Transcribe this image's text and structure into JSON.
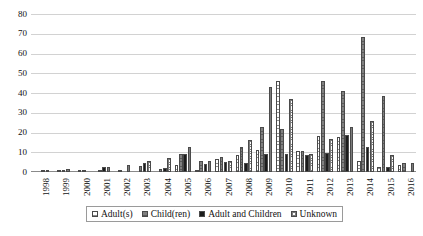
{
  "chart_data": {
    "type": "bar",
    "title": "",
    "subtitle": "",
    "xlabel": "",
    "ylabel": "",
    "ylim": [
      0,
      80
    ],
    "yticks": [
      0,
      10,
      20,
      30,
      40,
      50,
      60,
      70,
      80
    ],
    "grid": true,
    "legend_position": "bottom",
    "categories": [
      "1998",
      "1999",
      "2000",
      "2001",
      "2002",
      "2003",
      "2004",
      "2005",
      "2006",
      "2007",
      "2008",
      "2009",
      "2010",
      "2011",
      "2012",
      "2013",
      "2014",
      "2015",
      "2016"
    ],
    "series": [
      {
        "name": "Adult(s)",
        "pattern": "horizontal-lines",
        "color": "#f7f7f7",
        "values": [
          0,
          0,
          0,
          0,
          0,
          0,
          0,
          3.6,
          0.8,
          6.4,
          8.6,
          11,
          46,
          10.8,
          18,
          17.8,
          5.6,
          2.6,
          3.6
        ]
      },
      {
        "name": "Child(ren)",
        "pattern": "solid-gray",
        "color": "#6e6e6e",
        "values": [
          0,
          0.4,
          0.4,
          1,
          0.8,
          3,
          1.4,
          9,
          5.8,
          7.8,
          12.8,
          23,
          21.8,
          10.8,
          46,
          41,
          68.6,
          38.6,
          4.4
        ]
      },
      {
        "name": "Adult and Children",
        "pattern": "solid-black",
        "color": "#1c1c1c",
        "values": [
          0.8,
          1.2,
          0.6,
          2.4,
          0,
          4.6,
          2.2,
          9,
          4,
          5.2,
          4.6,
          9,
          9,
          8.6,
          9.8,
          18.6,
          12.6,
          2.6,
          0
        ]
      },
      {
        "name": "Unknown",
        "pattern": "checkered",
        "color": "#ffffff",
        "values": [
          1.2,
          1.4,
          0,
          2.4,
          3.8,
          5.6,
          7,
          12.8,
          5.6,
          5.6,
          16,
          43,
          37,
          9,
          16.6,
          22.6,
          25.8,
          8.6,
          4.4
        ]
      }
    ]
  },
  "legend": {
    "items": [
      {
        "label": "Adult(s)",
        "swatch": "swatch-horizontal-lines"
      },
      {
        "label": "Child(ren)",
        "swatch": "swatch-solid-gray"
      },
      {
        "label": "Adult and Children",
        "swatch": "swatch-solid-black"
      },
      {
        "label": "Unknown",
        "swatch": "swatch-checkered"
      }
    ]
  }
}
